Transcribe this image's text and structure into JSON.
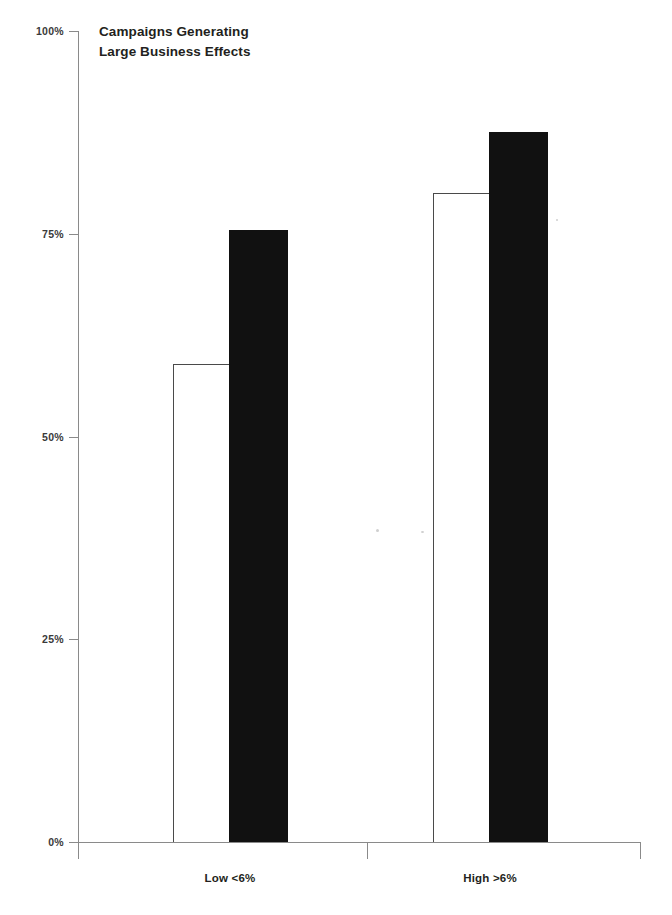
{
  "chart_data": {
    "type": "bar",
    "title": "Campaigns Generating\nLarge Business Effects",
    "title_line1": "Campaigns Generating",
    "title_line2": "Large Business Effects",
    "xlabel": "",
    "ylabel": "",
    "categories": [
      "Low <6%",
      "High >6%"
    ],
    "series": [
      {
        "name": "Open bar",
        "values": [
          59,
          80
        ],
        "color": "#ffffff",
        "edge_color": "#4a4a4a"
      },
      {
        "name": "Solid bar",
        "values": [
          75.5,
          87.5
        ],
        "color": "#111111",
        "edge_color": "#111111"
      }
    ],
    "ylim": [
      0,
      100
    ],
    "y_ticks": [
      0,
      25,
      50,
      75,
      100
    ],
    "y_tick_labels": [
      "0%",
      "25%",
      "50%",
      "75%",
      "100%"
    ],
    "grid": false,
    "legend": false,
    "units": "percent"
  },
  "axis": {
    "y_labels": [
      {
        "text": "100%",
        "value": 100
      },
      {
        "text": "75%",
        "value": 75
      },
      {
        "text": "50%",
        "value": 50
      },
      {
        "text": "25%",
        "value": 25
      },
      {
        "text": "0%",
        "value": 0
      }
    ],
    "x_labels": [
      {
        "text": "Low <6%",
        "center_pct": 23
      },
      {
        "text": "High >6%",
        "center_pct": 69
      }
    ]
  },
  "colors": {
    "axis": "#8a8a8a",
    "text": "#231f20",
    "tick_text": "#3a3a3a",
    "solid_bar": "#111111",
    "open_bar_fill": "#ffffff",
    "open_bar_edge": "#4a4a4a",
    "background": "#ffffff"
  }
}
